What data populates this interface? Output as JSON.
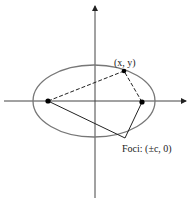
{
  "diagram": {
    "point_label": "(x, y)",
    "foci_label": "Foci: (±c, 0)",
    "colors": {
      "background": "#ffffff",
      "ellipse": "#777777",
      "axes": "#444444",
      "lines": "#222222",
      "points": "#000000"
    }
  }
}
